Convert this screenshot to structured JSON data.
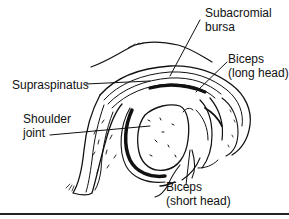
{
  "diagram": {
    "colors": {
      "ink": "#111111",
      "background": "#ffffff"
    },
    "labels": {
      "subacromial_bursa": {
        "line1": "Subacromial",
        "line2": "bursa"
      },
      "biceps_long_head": {
        "line1": "Biceps",
        "line2": "(long head)"
      },
      "supraspinatus": {
        "line1": "Supraspinatus"
      },
      "shoulder_joint": {
        "line1": "Shoulder",
        "line2": "joint"
      },
      "biceps_short_head": {
        "line1": "Biceps",
        "line2": "(short head)"
      }
    }
  }
}
